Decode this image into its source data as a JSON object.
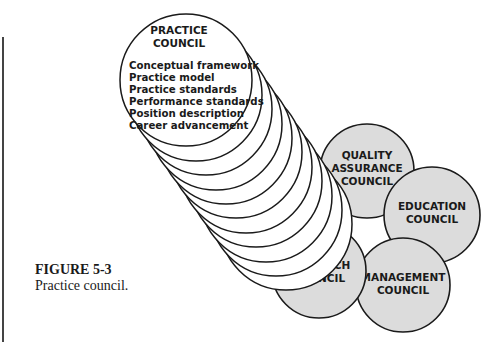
{
  "figure": {
    "number": "FIGURE 5-3",
    "caption": "Practice council."
  },
  "practice_council": {
    "title_line1": "PRACTICE",
    "title_line2": "COUNCIL",
    "items": [
      "Conceptual framework",
      "Practice model",
      "Practice standards",
      "Performance standards",
      "Position description",
      "Career advancement"
    ]
  },
  "councils": {
    "quality": {
      "line1": "QUALITY",
      "line2": "ASSURANCE",
      "line3": "COUNCIL"
    },
    "education": {
      "line1": "EDUCATION",
      "line2": "COUNCIL"
    },
    "research": {
      "line1": "RESEARCH",
      "line2": "COUNCIL"
    },
    "management": {
      "line1": "MANAGEMENT",
      "line2": "COUNCIL"
    }
  },
  "colors": {
    "council_fill": "#dcdcdc",
    "stroke": "#1a1a1a"
  }
}
